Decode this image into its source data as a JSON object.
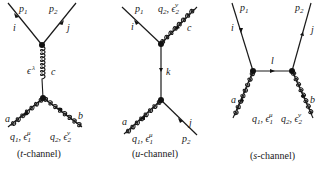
{
  "diagrams": [
    {
      "id": "t-channel",
      "caption_italic": "t",
      "caption_rest": "-channel)",
      "caption_open": "(",
      "labels": {
        "p1": "p",
        "p1_sub": "1",
        "p2": "p",
        "p2_sub": "2",
        "i": "i",
        "j": "j",
        "eps_lambda": "ϵ",
        "eps_lambda_sup": "λ",
        "c": "c",
        "a": "a",
        "b": "b",
        "q1": "q",
        "q1_sub": "1",
        "q1_eps": ", ϵ",
        "q1_eps_sub": "1",
        "q1_eps_sup": "μ",
        "q2": "q",
        "q2_sub": "2",
        "q2_eps": ", ϵ",
        "q2_eps_sub": "2",
        "q2_eps_sup": "ν"
      }
    },
    {
      "id": "u-channel",
      "caption_italic": "u",
      "caption_rest": "-channel)",
      "caption_open": "(",
      "labels": {
        "p1": "p",
        "p1_sub": "1",
        "p2": "p",
        "p2_sub": "2",
        "i": "i",
        "j": "j",
        "k": "k",
        "c": "c",
        "a": "a",
        "q1": "q",
        "q1_sub": "1",
        "q1_eps": ", ϵ",
        "q1_eps_sub": "1",
        "q1_eps_sup": "μ",
        "q2": "q",
        "q2_sub": "2",
        "q2_eps": ", ϵ",
        "q2_eps_sub": "2",
        "q2_eps_sup": "ν"
      }
    },
    {
      "id": "s-channel",
      "caption_italic": "s",
      "caption_rest": "-channel)",
      "caption_open": "(",
      "labels": {
        "p1": "p",
        "p1_sub": "1",
        "p2": "p",
        "p2_sub": "2",
        "i": "i",
        "j": "j",
        "l": "l",
        "a": "a",
        "b": "b",
        "q1": "q",
        "q1_sub": "1",
        "q1_eps": ", ϵ",
        "q1_eps_sub": "1",
        "q1_eps_sup": "μ",
        "q2": "q",
        "q2_sub": "2",
        "q2_eps": ", ϵ",
        "q2_eps_sub": "2",
        "q2_eps_sup": "ν"
      }
    }
  ]
}
